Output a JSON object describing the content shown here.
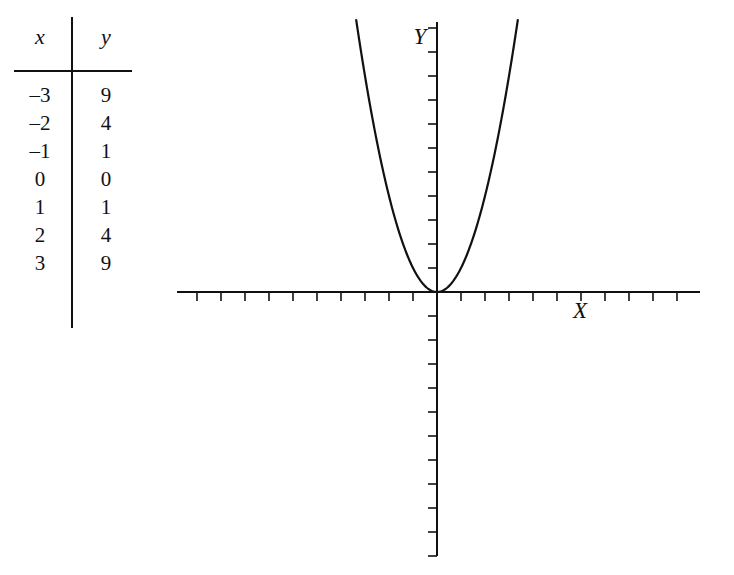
{
  "figure": {
    "kind": "cartesian-plot-with-value-table",
    "background_color": "#ffffff",
    "ink_color": "#111111"
  },
  "table": {
    "headers": {
      "x": "x",
      "y": "y"
    },
    "rows": [
      {
        "x": "–3",
        "y": "9"
      },
      {
        "x": "–2",
        "y": "4"
      },
      {
        "x": "–1",
        "y": "1"
      },
      {
        "x": "0",
        "y": "0"
      },
      {
        "x": "1",
        "y": "1"
      },
      {
        "x": "2",
        "y": "4"
      },
      {
        "x": "3",
        "y": "9"
      }
    ]
  },
  "chart_data": {
    "type": "line",
    "title": "",
    "subtitle": "",
    "xlabel": "X",
    "ylabel": "Y",
    "equation": "y = x^2",
    "grid": false,
    "legend": null,
    "axis_style": "cartesian-cross-with-unlabeled-ticks",
    "xlim": [
      -10.9,
      11.0
    ],
    "ylim": [
      -11.9,
      11.3
    ],
    "x_tick_count_left": 10,
    "x_tick_count_right": 10,
    "y_tick_count_up": 11,
    "y_tick_count_down": 11,
    "tick_spacing_px": 24,
    "tick_length_px": 9,
    "x": [
      -2.9,
      -2.6,
      -2.3,
      -2.0,
      -1.7,
      -1.4,
      -1.1,
      -0.8,
      -0.5,
      -0.2,
      0.0,
      0.2,
      0.5,
      0.8,
      1.1,
      1.4,
      1.7,
      2.0,
      2.3,
      2.6,
      2.9
    ],
    "values": [
      8.41,
      6.76,
      5.29,
      4.0,
      2.89,
      1.96,
      1.21,
      0.64,
      0.25,
      0.04,
      0.0,
      0.04,
      0.25,
      0.64,
      1.21,
      1.96,
      2.89,
      4.0,
      5.29,
      6.76,
      8.41
    ],
    "series": [
      {
        "name": "y = x^2",
        "points": [
          [
            -3,
            9
          ],
          [
            -2,
            4
          ],
          [
            -1,
            1
          ],
          [
            0,
            0
          ],
          [
            1,
            1
          ],
          [
            2,
            4
          ],
          [
            3,
            9
          ]
        ]
      }
    ]
  },
  "icons": {
    "x_axis_label": "x-axis-label",
    "y_axis_label": "y-axis-label"
  }
}
